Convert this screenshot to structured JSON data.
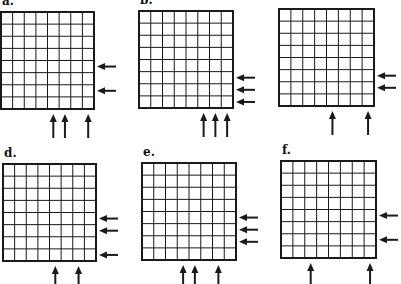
{
  "figure": {
    "grid_size": 8,
    "line_color": "#1a1a1a",
    "panels": [
      {
        "label": "a.",
        "label_visible": true,
        "x": 1,
        "y": 12,
        "w": 93,
        "h": 97,
        "bottom_arrow_cols": [
          5,
          6,
          8
        ],
        "right_arrow_rows": [
          5,
          7
        ]
      },
      {
        "label": "b.",
        "label_visible": true,
        "x": 139,
        "y": 11,
        "w": 94,
        "h": 97,
        "bottom_arrow_cols": [
          6,
          7,
          8
        ],
        "right_arrow_rows": [
          6,
          7,
          8
        ]
      },
      {
        "label": "c.",
        "label_visible": false,
        "x": 279,
        "y": 9,
        "w": 95,
        "h": 97,
        "bottom_arrow_cols": [
          5,
          8
        ],
        "right_arrow_rows": [
          6,
          7
        ]
      },
      {
        "label": "d.",
        "label_visible": true,
        "x": 3,
        "y": 164,
        "w": 93,
        "h": 97,
        "bottom_arrow_cols": [
          5,
          7
        ],
        "right_arrow_rows": [
          5,
          6,
          8
        ]
      },
      {
        "label": "e.",
        "label_visible": true,
        "x": 142,
        "y": 163,
        "w": 94,
        "h": 97,
        "bottom_arrow_cols": [
          4,
          5,
          7
        ],
        "right_arrow_rows": [
          5,
          6,
          7
        ]
      },
      {
        "label": "f.",
        "label_visible": true,
        "x": 281,
        "y": 161,
        "w": 95,
        "h": 97,
        "bottom_arrow_cols": [
          3,
          8
        ],
        "right_arrow_rows": [
          5,
          7
        ]
      }
    ]
  }
}
